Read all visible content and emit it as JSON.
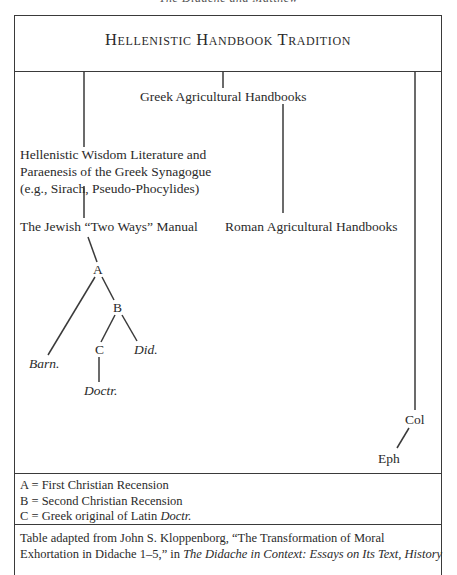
{
  "running_head": "The Didache and Matthew",
  "diagram": {
    "title": "Hellenistic Handbook Tradition",
    "nodes": {
      "greek_agricultural": "Greek Agricultural Handbooks",
      "hellenistic_wisdom": [
        "Hellenistic Wisdom Literature and",
        "Paraenesis of the Greek Synagogue",
        "(e.g., Sirach, Pseudo-Phocylides)"
      ],
      "jewish_two_ways": "The Jewish “Two Ways” Manual",
      "roman_agricultural": "Roman Agricultural Handbooks",
      "A": "A",
      "B": "B",
      "C": "C",
      "barn": "Barn.",
      "did": "Did.",
      "doctr": "Doctr.",
      "col": "Col",
      "eph": "Eph"
    },
    "edges": [
      [
        "title",
        "greek_agricultural"
      ],
      [
        "title",
        "hellenistic_wisdom"
      ],
      [
        "title",
        "col"
      ],
      [
        "greek_agricultural",
        "roman_agricultural"
      ],
      [
        "hellenistic_wisdom",
        "jewish_two_ways"
      ],
      [
        "jewish_two_ways",
        "A"
      ],
      [
        "A",
        "barn"
      ],
      [
        "A",
        "B"
      ],
      [
        "B",
        "C"
      ],
      [
        "B",
        "did"
      ],
      [
        "C",
        "doctr"
      ],
      [
        "col",
        "eph"
      ]
    ]
  },
  "legend": [
    {
      "key": "A",
      "sep": " = ",
      "text": "First Christian Recension",
      "italic_suffix": ""
    },
    {
      "key": "B",
      "sep": " = ",
      "text": "Second Christian Recension",
      "italic_suffix": ""
    },
    {
      "key": "C",
      "sep": " = ",
      "text": "Greek original of Latin ",
      "italic_suffix": "Doctr."
    }
  ],
  "source": {
    "line1": "Table adapted from John S. Kloppenborg, “The Transformation of Moral",
    "line2_plain": "Exhortation in Didache 1–5,” in ",
    "line2_italic": "The Didache in Context: Essays on Its Text, History"
  }
}
